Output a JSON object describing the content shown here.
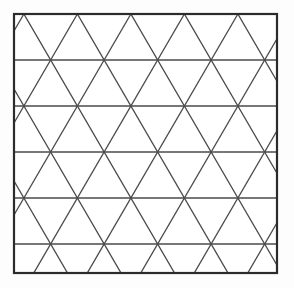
{
  "page": {
    "background_color": "#fdfdfd",
    "width": 294,
    "height": 288
  },
  "figure": {
    "name": "triangular-lattice",
    "background_color": "#ffffff",
    "frame": {
      "x": 14,
      "y": 14,
      "width": 263,
      "height": 259,
      "stroke_color": "#2b2b2b",
      "stroke_width": 2.2
    },
    "grid": {
      "line_color": "#4a4a4a",
      "line_width": 1.3,
      "row_spacing": 46,
      "vertex_spacing": 53.5,
      "half_offset": 26.75,
      "horizontal_rows_y": [
        14,
        60,
        106,
        152,
        198,
        244
      ],
      "row_vertices_x": {
        "phase_a": [
          62,
          115.5,
          169,
          222.5,
          276
        ],
        "phase_b": [
          35.25,
          88.75,
          142.25,
          195.75,
          249.25
        ]
      },
      "horizontal_line_count": 6,
      "diagonal_direction_count": 2,
      "diagonal_slope_degrees": 60
    }
  }
}
